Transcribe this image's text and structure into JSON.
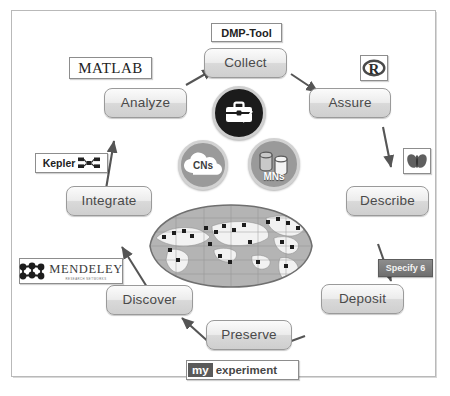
{
  "diagram": {
    "frame_color": "#b9b9b9"
  },
  "steps": [
    {
      "id": "collect",
      "label": "Collect"
    },
    {
      "id": "assure",
      "label": "Assure"
    },
    {
      "id": "describe",
      "label": "Describe"
    },
    {
      "id": "deposit",
      "label": "Deposit"
    },
    {
      "id": "preserve",
      "label": "Preserve"
    },
    {
      "id": "discover",
      "label": "Discover"
    },
    {
      "id": "integrate",
      "label": "Integrate"
    },
    {
      "id": "analyze",
      "label": "Analyze"
    }
  ],
  "tools": {
    "dmp_tool": "DMP-Tool",
    "matlab": "MATLAB",
    "kepler": "Kepler",
    "mendeley": "MENDELEY",
    "mendeley_sub": "RESEARCH NETWORKS",
    "r_logo": "R",
    "morpho": "morpho-butterfly-icon",
    "specify": "Specify 6",
    "myexperiment_my": "my",
    "myexperiment_word": "experiment"
  },
  "nodes": [
    {
      "id": "itk",
      "label": "",
      "icon": "toolbox-icon"
    },
    {
      "id": "cns",
      "label": "CNs",
      "icon": "cloud-icon"
    },
    {
      "id": "mns",
      "label": "MNs",
      "icon": "database-cylinders-icon"
    }
  ],
  "center": {
    "map": "world-map-robinson-projection",
    "marker_count": 24
  },
  "colors": {
    "button_face": "#e4e4e4",
    "button_border": "#9a9a9a",
    "text": "#4a4a4a",
    "badge_dark": "#1b1b1b",
    "badge_gray": "#9a9a9a",
    "specify_bg": "#7d7d7d"
  }
}
